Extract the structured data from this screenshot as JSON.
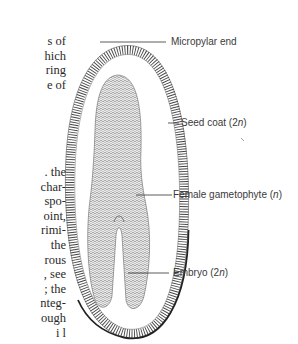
{
  "body_text": {
    "top_lines": [
      "s of",
      "hich",
      "ring",
      "e of"
    ],
    "bottom_lines": [
      ". the",
      "char-",
      "spo-",
      "oint,",
      "rimi-",
      "the",
      "rous",
      ", see",
      "; the",
      "nteg-",
      "ough",
      "i l"
    ]
  },
  "figure": {
    "labels": [
      {
        "id": "micropylar-end",
        "text": "Micropylar end",
        "italic_suffix": ""
      },
      {
        "id": "seed-coat",
        "text": "Seed coat (2",
        "italic_suffix": "n",
        "close": ")"
      },
      {
        "id": "female-gametophyte",
        "text": "Female gametophyte (",
        "italic_suffix": "n",
        "close": ")"
      },
      {
        "id": "embryo",
        "text": "Embryo (2",
        "italic_suffix": "n",
        "close": ")"
      }
    ],
    "colors": {
      "line": "#333333",
      "hatch": "#444444",
      "stipple": "#6a6a6a",
      "label_text": "#3a3a3a"
    }
  }
}
